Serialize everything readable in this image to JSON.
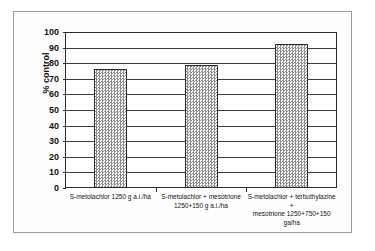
{
  "chart_data": {
    "type": "bar",
    "title": "",
    "subtitle": "",
    "xlabel": "",
    "ylabel": "% control",
    "ylim": [
      0,
      100
    ],
    "ytick_interval": 10,
    "yticks": [
      "100",
      "90",
      "80",
      "70",
      "60",
      "50",
      "40",
      "30",
      "20",
      "10",
      "0"
    ],
    "grid": true,
    "legend": false,
    "legend_position": "none",
    "categories": [
      "S-metolachlor 1250 g a.i./ha",
      "S-metolachlor + mesotrione 1250+150 g a.i./ha",
      "S-metolachlor + terbuthylazine + mesotrione 1250+750+150 ga/ha"
    ],
    "category_lines": [
      [
        "S-metolachlor 1250 g a.i./ha"
      ],
      [
        "S-metolachlor + mesotrione",
        "1250+150 g a.i./ha"
      ],
      [
        "S-metolachlor + terbuthylazine +",
        "mesotrione 1250+750+150",
        "ga/ha"
      ]
    ],
    "values": [
      76,
      79,
      92
    ],
    "bar_fill": "#8f8f8f",
    "bar_border": "#2b2b2b",
    "axis_color": "#2b2b2b",
    "frame_color": "#9a9a9a"
  }
}
